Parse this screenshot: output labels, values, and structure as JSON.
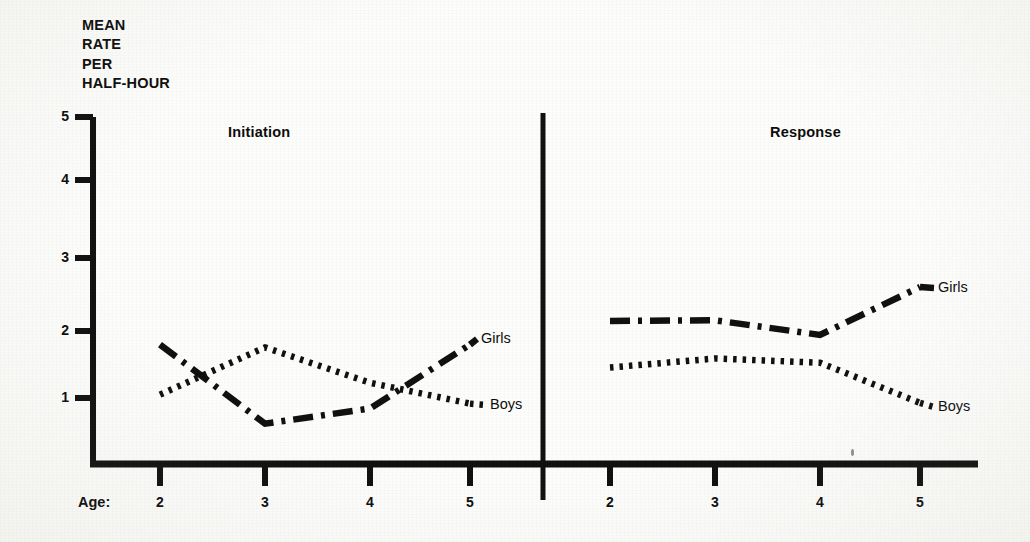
{
  "figure": {
    "y_axis_title": "MEAN\nRATE\nPER\nHALF-HOUR",
    "age_axis_label": "Age:",
    "panels": [
      {
        "key": "initiation",
        "title": "Initiation"
      },
      {
        "key": "response",
        "title": "Response"
      }
    ],
    "y_tick_labels": [
      "5",
      "4",
      "3",
      "2",
      "1"
    ],
    "x_tick_labels": [
      "2",
      "3",
      "4",
      "5"
    ],
    "series_labels": {
      "girls": "Girls",
      "boys": "Boys"
    },
    "colors": {
      "ink": "#111111",
      "paper": "#fdfdfb"
    }
  },
  "chart_data": {
    "type": "line",
    "title": "",
    "xlabel": "Age:",
    "ylabel": "MEAN RATE PER HALF-HOUR",
    "ylim": [
      0,
      5
    ],
    "yticks": [
      1,
      2,
      3,
      4,
      5
    ],
    "x": [
      2,
      3,
      4,
      5
    ],
    "xlabel_values": [
      "2",
      "3",
      "4",
      "5"
    ],
    "grid": false,
    "legend": "inline-right-of-line-ends",
    "panels": [
      {
        "name": "Initiation",
        "series": [
          {
            "name": "Girls",
            "style": "dash-dot",
            "values": [
              1.72,
              0.58,
              0.8,
              1.72
            ]
          },
          {
            "name": "Boys",
            "style": "dotted",
            "values": [
              1.0,
              1.68,
              1.17,
              0.87
            ]
          }
        ]
      },
      {
        "name": "Response",
        "series": [
          {
            "name": "Girls",
            "style": "dash-dot",
            "values": [
              2.06,
              2.07,
              1.86,
              2.55
            ]
          },
          {
            "name": "Boys",
            "style": "dotted",
            "values": [
              1.39,
              1.52,
              1.46,
              0.88
            ]
          }
        ]
      }
    ]
  },
  "geometry": {
    "y_axis_x": 93,
    "y_top": 117,
    "y_bottom": 464,
    "value_at_top": 5,
    "baseline_y": 464,
    "divider_x": 543,
    "divider_top": 113,
    "divider_bottom": 500,
    "x_axis_right": 978,
    "panel_x": [
      [
        160,
        265,
        370,
        470
      ],
      [
        610,
        715,
        820,
        920
      ]
    ],
    "y_tick_pixels": [
      117,
      180,
      258,
      331,
      398
    ],
    "label_positions": {
      "initiation_girls": {
        "x": 481,
        "y": 330
      },
      "initiation_boys": {
        "x": 490,
        "y": 396
      },
      "response_girls": {
        "x": 938,
        "y": 279
      },
      "response_boys": {
        "x": 938,
        "y": 398
      }
    }
  }
}
